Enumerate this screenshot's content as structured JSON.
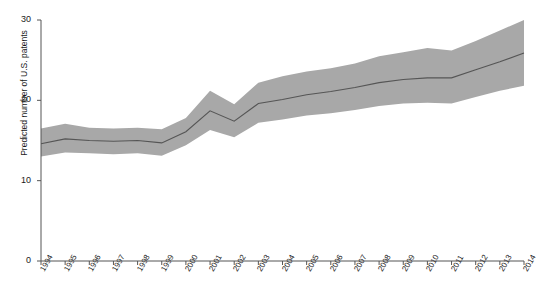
{
  "chart_data": {
    "type": "line",
    "title": "",
    "xlabel": "",
    "ylabel": "Predicted number of U.S. patents",
    "xlim": [
      1994,
      2014
    ],
    "ylim": [
      0,
      30
    ],
    "yticks": [
      0,
      10,
      20,
      30
    ],
    "grid": false,
    "legend": null,
    "x": [
      1994,
      1995,
      1996,
      1997,
      1998,
      1999,
      2000,
      2001,
      2002,
      2003,
      2004,
      2005,
      2006,
      2007,
      2008,
      2009,
      2010,
      2011,
      2012,
      2013,
      2014
    ],
    "series": [
      {
        "name": "Predicted number of U.S. patents",
        "type": "line",
        "color": "#555555",
        "values": [
          14.6,
          15.2,
          15.0,
          14.9,
          15.0,
          14.7,
          16.1,
          18.7,
          17.4,
          19.6,
          20.1,
          20.7,
          21.1,
          21.6,
          22.2,
          22.6,
          22.8,
          22.8,
          23.8,
          24.8,
          25.9
        ]
      },
      {
        "name": "Confidence band (upper)",
        "type": "band-upper",
        "color": "#a8a8a8",
        "values": [
          16.5,
          17.1,
          16.6,
          16.5,
          16.6,
          16.4,
          17.8,
          21.2,
          19.5,
          22.2,
          23.0,
          23.6,
          24.0,
          24.6,
          25.5,
          26.0,
          26.5,
          26.2,
          27.4,
          28.7,
          30.0
        ]
      },
      {
        "name": "Confidence band (lower)",
        "type": "band-lower",
        "color": "#a8a8a8",
        "values": [
          13.0,
          13.5,
          13.4,
          13.3,
          13.4,
          13.1,
          14.4,
          16.3,
          15.4,
          17.2,
          17.6,
          18.1,
          18.4,
          18.8,
          19.3,
          19.6,
          19.7,
          19.6,
          20.4,
          21.2,
          21.8
        ]
      }
    ],
    "band_fill_color": "#a8a8a8",
    "line_color": "#555555",
    "axis_color": "#555555",
    "background": "#ffffff"
  },
  "axes": {
    "y_tick_labels": [
      "0",
      "10",
      "20",
      "30"
    ],
    "x_tick_labels": [
      "1994",
      "1995",
      "1996",
      "1997",
      "1998",
      "1999",
      "2000",
      "2001",
      "2002",
      "2003",
      "2004",
      "2005",
      "2006",
      "2007",
      "2008",
      "2009",
      "2010",
      "2011",
      "2012",
      "2013",
      "2014"
    ],
    "y_axis_title": "Predicted number of U.S. patents"
  }
}
